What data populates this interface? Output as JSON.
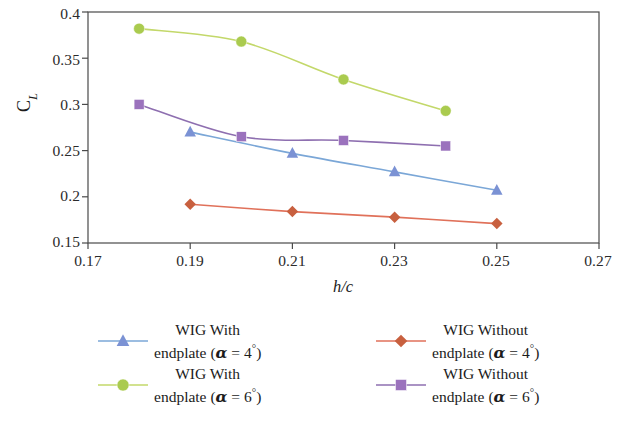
{
  "chart_data": {
    "type": "line",
    "title": "",
    "xlabel": "h/c",
    "ylabel": "C_L",
    "xlim": [
      0.17,
      0.27
    ],
    "ylim": [
      0.15,
      0.4
    ],
    "xticks": [
      "0.17",
      "0.19",
      "0.21",
      "0.23",
      "0.25",
      "0.27"
    ],
    "yticks": [
      "0.15",
      "0.2",
      "0.25",
      "0.3",
      "0.35",
      "0.4"
    ],
    "grid": false,
    "legend_position": "below",
    "series": [
      {
        "name": "WIG With endplate (α = 4°)",
        "marker": "triangle",
        "color": "#7ba7d7",
        "marker_color": "#7b92d4",
        "x": [
          0.19,
          0.21,
          0.23,
          0.25
        ],
        "values": [
          0.27,
          0.247,
          0.227,
          0.207
        ]
      },
      {
        "name": "WIG With endplate (α = 6°)",
        "marker": "circle",
        "color": "#c3d86a",
        "marker_color": "#aacb4f",
        "x": [
          0.18,
          0.2,
          0.22,
          0.24
        ],
        "values": [
          0.382,
          0.368,
          0.327,
          0.293
        ]
      },
      {
        "name": "WIG Without endplate (α = 4°)",
        "marker": "diamond",
        "color": "#e0715a",
        "marker_color": "#c8603f",
        "x": [
          0.19,
          0.21,
          0.23,
          0.25
        ],
        "values": [
          0.192,
          0.184,
          0.178,
          0.171
        ]
      },
      {
        "name": "WIG Without endplate (α = 6°)",
        "marker": "square",
        "color": "#8e6fb0",
        "marker_color": "#9b72bd",
        "x": [
          0.18,
          0.2,
          0.22,
          0.24
        ],
        "values": [
          0.3,
          0.265,
          0.261,
          0.255
        ]
      }
    ]
  },
  "axes": {
    "y_label_main": "C",
    "y_label_sub": "L",
    "x_label": "h/c",
    "x_tick_labels": [
      "0.17",
      "0.19",
      "0.21",
      "0.23",
      "0.25",
      "0.27"
    ],
    "y_tick_labels": [
      "0.4",
      "0.35",
      "0.3",
      "0.25",
      "0.2",
      "0.15"
    ]
  },
  "legend": {
    "entries": [
      {
        "id": "blue",
        "line1": "WIG With",
        "line2_prefix": "endplate (",
        "symbol": "α",
        "line2_mid": " = 4",
        "degree": "°",
        "line2_suffix": ")"
      },
      {
        "id": "green",
        "line1": "WIG With",
        "line2_prefix": "endplate (",
        "symbol": "α",
        "line2_mid": " = 6",
        "degree": "°",
        "line2_suffix": ")"
      },
      {
        "id": "red",
        "line1": "WIG Without",
        "line2_prefix": "endplate (",
        "symbol": "α",
        "line2_mid": " = 4",
        "degree": "°",
        "line2_suffix": ")"
      },
      {
        "id": "purple",
        "line1": "WIG Without",
        "line2_prefix": "endplate (",
        "symbol": "α",
        "line2_mid": " = 6",
        "degree": "°",
        "line2_suffix": ")"
      }
    ]
  }
}
